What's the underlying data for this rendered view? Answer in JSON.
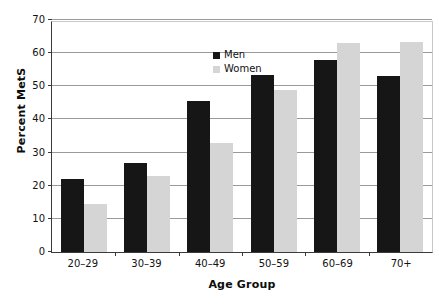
{
  "chart_data": {
    "type": "bar",
    "title": "",
    "xlabel": "Age Group",
    "ylabel": "Percent MetS",
    "categories": [
      "20–29",
      "30–39",
      "40–49",
      "50–59",
      "60–69",
      "70+"
    ],
    "series": [
      {
        "name": "Men",
        "color": "#161616",
        "values": [
          22,
          27,
          45.5,
          53.5,
          58,
          53
        ]
      },
      {
        "name": "Women",
        "color": "#d5d5d5",
        "values": [
          14.5,
          23,
          33,
          49,
          63,
          63.5
        ]
      }
    ],
    "ylim": [
      0,
      70
    ],
    "ytick_values": [
      0,
      10,
      20,
      30,
      40,
      50,
      60,
      70
    ],
    "ytick_labels": [
      "0",
      "10",
      "20",
      "30",
      "40",
      "50",
      "60",
      "70"
    ],
    "grid": true,
    "grid_axis": "y",
    "legend_position": "upper center",
    "bar_group_order": [
      "Men",
      "Women"
    ]
  },
  "legend": {
    "items": [
      {
        "label": "Men",
        "swatch": "black-square-swatch"
      },
      {
        "label": "Women",
        "swatch": "gray-square-swatch"
      }
    ]
  }
}
